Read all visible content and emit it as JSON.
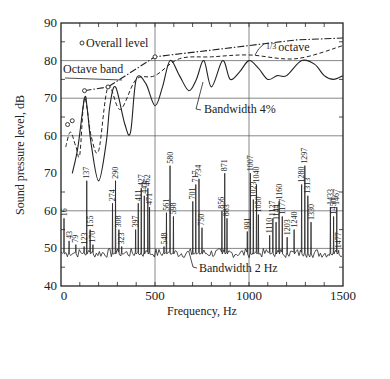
{
  "chart_data": {
    "type": "line",
    "title": "",
    "xlabel": "Frequency, Hz",
    "ylabel": "Sound pressure level, dB",
    "xlim": [
      0,
      1500
    ],
    "x_ticks": [
      0,
      500,
      1000,
      1500
    ],
    "x_minor_step": 100,
    "grid": true,
    "upper_scale": {
      "ylim": [
        60,
        90
      ],
      "ticks": [
        90,
        80,
        70,
        60
      ]
    },
    "lower_scale": {
      "ylim": [
        40,
        70
      ],
      "ticks": [
        70,
        60,
        50,
        40
      ]
    },
    "y_tick_labels": [
      "90",
      "80",
      "70",
      "60",
      "70",
      "60",
      "50",
      "40"
    ],
    "annotations": [
      {
        "text": "Overall level",
        "marker": "circle"
      },
      {
        "text": "Octave band"
      },
      {
        "text": "1/3 octave"
      },
      {
        "text": "Bandwidth 4%"
      },
      {
        "text": "Bandwidth 2 Hz"
      }
    ],
    "series": [
      {
        "name": "Overall level",
        "scale": "upper",
        "style": "markers",
        "x": [
          35,
          60
        ],
        "y": [
          63,
          64
        ]
      },
      {
        "name": "Octave band",
        "scale": "upper",
        "style": "dash-dot with circle markers",
        "x": [
          125,
          250,
          500,
          1000,
          1250,
          1500
        ],
        "y": [
          72,
          73,
          81,
          84,
          85.5,
          86
        ]
      },
      {
        "name": "1/3 octave",
        "scale": "upper",
        "style": "dashed",
        "x": [
          25,
          50,
          80,
          100,
          125,
          160,
          200,
          250,
          315,
          400,
          500,
          630,
          800,
          1000,
          1250,
          1500
        ],
        "y": [
          57,
          61,
          57,
          55,
          70,
          60,
          56,
          73,
          67,
          75,
          76,
          80.5,
          81,
          81.5,
          80.5,
          84
        ]
      },
      {
        "name": "Bandwidth 4%",
        "scale": "upper",
        "style": "solid",
        "x": [
          60,
          90,
          125,
          140,
          160,
          200,
          240,
          260,
          290,
          340,
          370,
          400,
          450,
          500,
          540,
          580,
          630,
          680,
          720,
          760,
          800,
          860,
          900,
          950,
          1000,
          1050,
          1100,
          1150,
          1200,
          1280,
          1350,
          1400,
          1450,
          1500
        ],
        "y": [
          50,
          57,
          70,
          67,
          58,
          48,
          58,
          68,
          73,
          63,
          61,
          75,
          74,
          68,
          73,
          80,
          76,
          72,
          75,
          80,
          73,
          80,
          75,
          77,
          80,
          78,
          75,
          76,
          76,
          80,
          79,
          76,
          75,
          76
        ]
      }
    ],
    "narrowband_2hz": {
      "name": "Bandwidth 2 Hz",
      "scale": "lower",
      "baseline_db": 49,
      "peaks": [
        {
          "f": 16,
          "db": 58
        },
        {
          "f": 43,
          "db": 52
        },
        {
          "f": 79,
          "db": 51
        },
        {
          "f": 123,
          "db": 50.5
        },
        {
          "f": 137,
          "db": 68
        },
        {
          "f": 155,
          "db": 55
        },
        {
          "f": 170,
          "db": 51
        },
        {
          "f": 274,
          "db": 62
        },
        {
          "f": 290,
          "db": 68
        },
        {
          "f": 308,
          "db": 55
        },
        {
          "f": 323,
          "db": 50.5
        },
        {
          "f": 397,
          "db": 55
        },
        {
          "f": 411,
          "db": 62
        },
        {
          "f": 427,
          "db": 66
        },
        {
          "f": 443,
          "db": 64
        },
        {
          "f": 462,
          "db": 66
        },
        {
          "f": 471,
          "db": 61
        },
        {
          "f": 548,
          "db": 50.5
        },
        {
          "f": 561,
          "db": 59.5
        },
        {
          "f": 580,
          "db": 72
        },
        {
          "f": 598,
          "db": 58.5
        },
        {
          "f": 701,
          "db": 62.5
        },
        {
          "f": 717,
          "db": 67
        },
        {
          "f": 734,
          "db": 68.5
        },
        {
          "f": 750,
          "db": 55.5
        },
        {
          "f": 856,
          "db": 60
        },
        {
          "f": 871,
          "db": 70
        },
        {
          "f": 883,
          "db": 58
        },
        {
          "f": 991,
          "db": 54.5
        },
        {
          "f": 1007,
          "db": 70
        },
        {
          "f": 1023,
          "db": 63
        },
        {
          "f": 1040,
          "db": 67
        },
        {
          "f": 1050,
          "db": 59
        },
        {
          "f": 1110,
          "db": 53.5
        },
        {
          "f": 1127,
          "db": 58
        },
        {
          "f": 1144,
          "db": 57
        },
        {
          "f": 1160,
          "db": 62.5
        },
        {
          "f": 1177,
          "db": 58.5
        },
        {
          "f": 1203,
          "db": 53
        },
        {
          "f": 1280,
          "db": 67
        },
        {
          "f": 1297,
          "db": 72
        },
        {
          "f": 1313,
          "db": 64
        },
        {
          "f": 1330,
          "db": 57
        },
        {
          "f": 1240,
          "db": 55
        },
        {
          "f": 1433,
          "db": 61
        },
        {
          "f": 1450,
          "db": 58.5
        },
        {
          "f": 1467,
          "db": 61
        },
        {
          "f": 1477,
          "db": 49.5
        }
      ]
    }
  }
}
